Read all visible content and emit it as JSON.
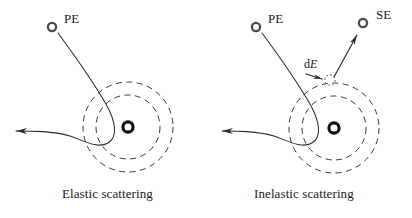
{
  "figure": {
    "background_color": "#ffffff",
    "stroke_color": "#2b2b2b",
    "title": "",
    "panels": [
      {
        "id": "elastic",
        "caption": "Elastic scattering",
        "incident_label": "PE",
        "incident_particle_icon": "open-circle-electron",
        "nucleus_icon": "nucleus-ring",
        "shell_count": 2,
        "nucleus_center": [
          128,
          127
        ],
        "shell_radii": [
          32,
          45
        ],
        "incident_circle_center": [
          52,
          27
        ],
        "outgoing_arrow_tip": [
          12,
          131
        ]
      },
      {
        "id": "inelastic",
        "caption": "Inelastic scattering",
        "incident_label": "PE",
        "secondary_label": "SE",
        "energy_label_prefix": "d",
        "energy_label_symbol": "E",
        "incident_particle_icon": "open-circle-electron",
        "secondary_particle_icon": "open-circle-electron",
        "nucleus_icon": "nucleus-ring",
        "ejected_site_icon": "dotted-circle-vacancy",
        "shell_count": 2,
        "nucleus_center": [
          334,
          128
        ],
        "shell_radii": [
          32,
          45
        ],
        "incident_circle_center": [
          256,
          27
        ],
        "secondary_circle_center": [
          363,
          23
        ],
        "ejected_site_center": [
          330,
          80
        ],
        "outgoing_arrow_tip": [
          218,
          131
        ]
      }
    ]
  }
}
